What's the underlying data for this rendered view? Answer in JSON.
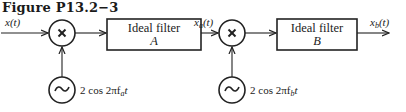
{
  "figure": {
    "title": "Figure P13.2−3"
  },
  "signals": {
    "input": {
      "base": "x",
      "sub": "",
      "arg": "(t)"
    },
    "middle": {
      "base": "x",
      "sub": "a",
      "arg": "(t)"
    },
    "output": {
      "base": "x",
      "sub": "b",
      "arg": "(t)"
    }
  },
  "blocks": [
    {
      "id": "multiplier-1",
      "type": "multiplier",
      "symbol": "×"
    },
    {
      "id": "filter-a",
      "type": "filter",
      "line1": "Ideal filter",
      "line2": "A"
    },
    {
      "id": "multiplier-2",
      "type": "multiplier",
      "symbol": "×"
    },
    {
      "id": "filter-b",
      "type": "filter",
      "line1": "Ideal filter",
      "line2": "B"
    }
  ],
  "oscillators": [
    {
      "id": "oscillator-a",
      "symbol": "~",
      "label_prefix": "2 cos 2πf",
      "label_sub": "a",
      "label_suffix": "t"
    },
    {
      "id": "oscillator-b",
      "symbol": "~",
      "label_prefix": "2 cos 2πf",
      "label_sub": "b",
      "label_suffix": "t"
    }
  ],
  "colors": {
    "stroke": "#222222",
    "background": "#ffffff"
  }
}
